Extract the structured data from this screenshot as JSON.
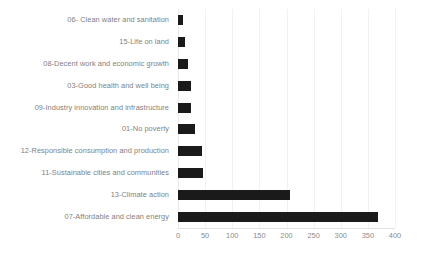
{
  "chart_data": {
    "type": "bar",
    "orientation": "horizontal",
    "title": "",
    "xlabel": "",
    "ylabel": "",
    "xlim": [
      0,
      400
    ],
    "xticks": [
      0,
      50,
      100,
      150,
      200,
      250,
      300,
      350,
      400
    ],
    "grid": true,
    "legend": false,
    "bar_color": "#1a1a1a",
    "label_color": "#7f7f7f",
    "gridline_color": "#f2f2f2",
    "categories": [
      "06- Clean water and sanitation",
      "15-Life on land",
      "08-Decent work and economic growth",
      "03-Good health and well being",
      "09-Industry innovation and infrastructure",
      "01-No poverty",
      "12-Responsible consumption and production",
      "11-Sustainable cities and communities",
      "13-Climate action",
      "07-Affordable and clean energy"
    ],
    "values": [
      9,
      12,
      19,
      24,
      24,
      31,
      44,
      46,
      207,
      369
    ]
  }
}
